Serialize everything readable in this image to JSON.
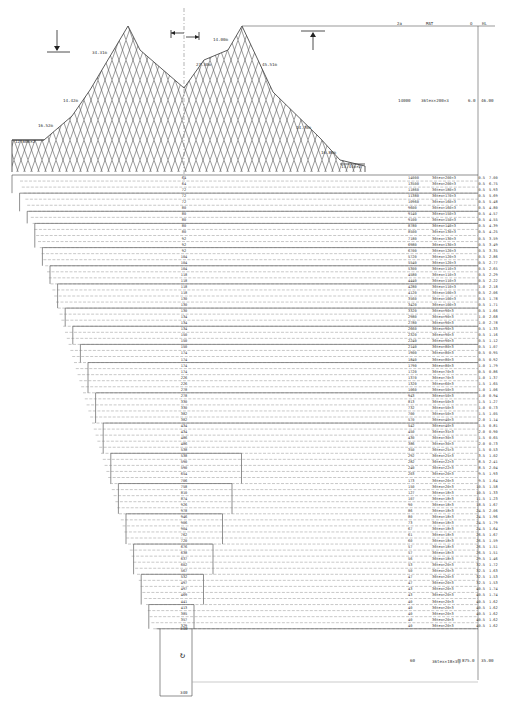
{
  "table": {
    "headers": {
      "n": "2a",
      "mat": "MAT",
      "o": "O",
      "hl": "HL"
    },
    "wing_row": {
      "n": "14000",
      "mat": "36tex×200×3",
      "o": "6.0",
      "hl": "46.00"
    },
    "codend_row": {
      "n": "60",
      "mat": "36tex×18×3单",
      "o": "875.0",
      "hl": "35.00"
    },
    "rows": [
      {
        "mesh": "64",
        "n": "14000",
        "mat": "36tex×200×3",
        "o": "0.5",
        "hl": "7.00"
      },
      {
        "mesh": "64",
        "n": "13500",
        "mat": "36tex×200×3",
        "o": "0.5",
        "hl": "6.75"
      },
      {
        "mesh": "72",
        "n": "11860",
        "mat": "36tex×180×3",
        "o": "0.5",
        "hl": "5.93"
      },
      {
        "mesh": "72",
        "n": "11380",
        "mat": "36tex×170×3",
        "o": "0.5",
        "hl": "5.69"
      },
      {
        "mesh": "72",
        "n": "10960",
        "mat": "36tex×160×3",
        "o": "0.5",
        "hl": "5.48"
      },
      {
        "mesh": "80",
        "n": "9600",
        "mat": "36tex×160×3",
        "o": "0.5",
        "hl": "4.80"
      },
      {
        "mesh": "80",
        "n": "9140",
        "mat": "36tex×150×3",
        "o": "0.5",
        "hl": "4.57"
      },
      {
        "mesh": "80",
        "n": "9100",
        "mat": "36tex×150×3",
        "o": "0.5",
        "hl": "4.55"
      },
      {
        "mesh": "80",
        "n": "8780",
        "mat": "36tex×140×3",
        "o": "0.5",
        "hl": "4.39"
      },
      {
        "mesh": "80",
        "n": "8500",
        "mat": "36tex×130×3",
        "o": "0.5",
        "hl": "4.25"
      },
      {
        "mesh": "92",
        "n": "7180",
        "mat": "36tex×130×3",
        "o": "0.5",
        "hl": "3.59"
      },
      {
        "mesh": "92",
        "n": "6980",
        "mat": "36tex×130×3",
        "o": "0.5",
        "hl": "3.49"
      },
      {
        "mesh": "92",
        "n": "6700",
        "mat": "36tex×120×3",
        "o": "0.5",
        "hl": "3.35"
      },
      {
        "mesh": "104",
        "n": "5720",
        "mat": "36tex×120×3",
        "o": "0.5",
        "hl": "2.86"
      },
      {
        "mesh": "104",
        "n": "5540",
        "mat": "36tex×120×3",
        "o": "0.5",
        "hl": "2.77"
      },
      {
        "mesh": "104",
        "n": "5300",
        "mat": "36tex×110×3",
        "o": "0.5",
        "hl": "2.65"
      },
      {
        "mesh": "118",
        "n": "4580",
        "mat": "36tex×110×3",
        "o": "0.5",
        "hl": "2.29"
      },
      {
        "mesh": "118",
        "n": "4440",
        "mat": "36tex×110×3",
        "o": "0.5",
        "hl": "2.22"
      },
      {
        "mesh": "118",
        "n": "4280",
        "mat": "36tex×110×3",
        "o": "1.0",
        "hl": "2.18"
      },
      {
        "mesh": "118",
        "n": "4120",
        "mat": "36tex×100×3",
        "o": "0.5",
        "hl": "2.06"
      },
      {
        "mesh": "130",
        "n": "3560",
        "mat": "36tex×100×3",
        "o": "0.5",
        "hl": "1.78"
      },
      {
        "mesh": "130",
        "n": "3420",
        "mat": "36tex×100×3",
        "o": "0.5",
        "hl": "1.71"
      },
      {
        "mesh": "130",
        "n": "3320",
        "mat": "36tex×90×3",
        "o": "0.5",
        "hl": "1.66"
      },
      {
        "mesh": "134",
        "n": "2980",
        "mat": "36tex×90×3",
        "o": "1.0",
        "hl": "2.68"
      },
      {
        "mesh": "134",
        "n": "2780",
        "mat": "36tex×90×3",
        "o": "1.0",
        "hl": "2.78"
      },
      {
        "mesh": "134",
        "n": "2660",
        "mat": "36tex×90×3",
        "o": "0.5",
        "hl": "1.33"
      },
      {
        "mesh": "150",
        "n": "2320",
        "mat": "36tex×90×3",
        "o": "0.5",
        "hl": "1.16"
      },
      {
        "mesh": "150",
        "n": "2240",
        "mat": "36tex×90×3",
        "o": "0.5",
        "hl": "1.12"
      },
      {
        "mesh": "150",
        "n": "2140",
        "mat": "36tex×80×3",
        "o": "0.5",
        "hl": "1.07"
      },
      {
        "mesh": "174",
        "n": "1900",
        "mat": "36tex×80×3",
        "o": "0.5",
        "hl": "0.95"
      },
      {
        "mesh": "174",
        "n": "1840",
        "mat": "36tex×80×3",
        "o": "0.5",
        "hl": "0.92"
      },
      {
        "mesh": "174",
        "n": "1790",
        "mat": "36tex×80×3",
        "o": "1.0",
        "hl": "1.79"
      },
      {
        "mesh": "174",
        "n": "1720",
        "mat": "36tex×70×3",
        "o": "0.5",
        "hl": "0.86"
      },
      {
        "mesh": "226",
        "n": "1370",
        "mat": "36tex×70×3",
        "o": "1.0",
        "hl": "1.37"
      },
      {
        "mesh": "226",
        "n": "1320",
        "mat": "36tex×60×3",
        "o": "1.5",
        "hl": "1.65"
      },
      {
        "mesh": "278",
        "n": "1060",
        "mat": "36tex×50×3",
        "o": "1.0",
        "hl": "1.06"
      },
      {
        "mesh": "278",
        "n": "943",
        "mat": "36tex×50×3",
        "o": "1.0",
        "hl": "0.94"
      },
      {
        "mesh": "330",
        "n": "813",
        "mat": "36tex×50×3",
        "o": "1.5",
        "hl": "1.27"
      },
      {
        "mesh": "330",
        "n": "732",
        "mat": "36tex×50×3",
        "o": "1.0",
        "hl": "0.73"
      },
      {
        "mesh": "382",
        "n": "700",
        "mat": "36tex×50×3",
        "o": "1.5",
        "hl": "1.05"
      },
      {
        "mesh": "382",
        "n": "570",
        "mat": "36tex×40×3",
        "o": "2.0",
        "hl": "1.14"
      },
      {
        "mesh": "434",
        "n": "542",
        "mat": "36tex×40×3",
        "o": "1.5",
        "hl": "0.81"
      },
      {
        "mesh": "434",
        "n": "450",
        "mat": "36tex×35×3",
        "o": "2.0",
        "hl": "0.90"
      },
      {
        "mesh": "486",
        "n": "430",
        "mat": "36tex×30×3",
        "o": "1.5",
        "hl": "0.65"
      },
      {
        "mesh": "486",
        "n": "386",
        "mat": "36tex×30×3",
        "o": "2.0",
        "hl": "0.73"
      },
      {
        "mesh": "538",
        "n": "350",
        "mat": "36tex×25×3",
        "o": "1.5",
        "hl": "0.53"
      },
      {
        "mesh": "538",
        "n": "292",
        "mat": "36tex×25×3",
        "o": "3.5",
        "hl": "1.02"
      },
      {
        "mesh": "590",
        "n": "282",
        "mat": "36tex×22×3",
        "o": "8.5",
        "hl": "2.41"
      },
      {
        "mesh": "590",
        "n": "240",
        "mat": "36tex×22×3",
        "o": "8.5",
        "hl": "2.04"
      },
      {
        "mesh": "654",
        "n": "203",
        "mat": "36tex×20×3",
        "o": "9.5",
        "hl": "1.93"
      },
      {
        "mesh": "706",
        "n": "173",
        "mat": "36tex×20×3",
        "o": "9.5",
        "hl": "1.64"
      },
      {
        "mesh": "758",
        "n": "150",
        "mat": "36tex×20×3",
        "o": "10.5",
        "hl": "1.58"
      },
      {
        "mesh": "810",
        "n": "127",
        "mat": "36tex×18×3",
        "o": "10.5",
        "hl": "1.33"
      },
      {
        "mesh": "874",
        "n": "107",
        "mat": "36tex×18×3",
        "o": "11.5",
        "hl": "1.23"
      },
      {
        "mesh": "926",
        "n": "90",
        "mat": "36tex×18×3",
        "o": "18.5",
        "hl": "1.67"
      },
      {
        "mesh": "978",
        "n": "86",
        "mat": "36tex×18×3",
        "o": "24.5",
        "hl": "2.06"
      },
      {
        "mesh": "946",
        "n": "80",
        "mat": "36tex×18×3",
        "o": "24.5",
        "hl": "1.96"
      },
      {
        "mesh": "906",
        "n": "73",
        "mat": "36tex×18×3",
        "o": "24.5",
        "hl": "1.79"
      },
      {
        "mesh": "904",
        "n": "67",
        "mat": "36tex×18×3",
        "o": "24.5",
        "hl": "1.64"
      },
      {
        "mesh": "762",
        "n": "61",
        "mat": "36tex×18×3",
        "o": "26.5",
        "hl": "1.67"
      },
      {
        "mesh": "720",
        "n": "60",
        "mat": "36tex×18×3",
        "o": "26.5",
        "hl": "1.59"
      },
      {
        "mesh": "676",
        "n": "57",
        "mat": "36tex×18×3",
        "o": "26.5",
        "hl": "1.51"
      },
      {
        "mesh": "638",
        "n": "57",
        "mat": "36tex×18×3",
        "o": "26.5",
        "hl": "1.51"
      },
      {
        "mesh": "637",
        "n": "56",
        "mat": "36tex×18×3",
        "o": "29.5",
        "hl": "1.46"
      },
      {
        "mesh": "602",
        "n": "53",
        "mat": "36tex×20×3",
        "o": "32.5",
        "hl": "1.72"
      },
      {
        "mesh": "567",
        "n": "50",
        "mat": "36tex×20×3",
        "o": "32.5",
        "hl": "1.63"
      },
      {
        "mesh": "532",
        "n": "47",
        "mat": "36tex×20×3",
        "o": "32.5",
        "hl": "1.53"
      },
      {
        "mesh": "497",
        "n": "47",
        "mat": "36tex×20×3",
        "o": "32.5",
        "hl": "1.53"
      },
      {
        "mesh": "497",
        "n": "43",
        "mat": "36tex×20×3",
        "o": "40.5",
        "hl": "1.74"
      },
      {
        "mesh": "469",
        "n": "43",
        "mat": "36tex×20×3",
        "o": "40.5",
        "hl": "1.74"
      },
      {
        "mesh": "441",
        "n": "40",
        "mat": "36tex×20×3",
        "o": "40.5",
        "hl": "1.62"
      },
      {
        "mesh": "413",
        "n": "40",
        "mat": "36tex×20×3",
        "o": "40.5",
        "hl": "1.62"
      },
      {
        "mesh": "385",
        "n": "40",
        "mat": "36tex×20×3",
        "o": "40.5",
        "hl": "1.62"
      },
      {
        "mesh": "357",
        "n": "40",
        "mat": "36tex×20×3",
        "o": "40.5",
        "hl": "1.62"
      },
      {
        "mesh": "329",
        "n": "40",
        "mat": "36tex×20×3",
        "o": "40.5",
        "hl": "1.62"
      }
    ],
    "codend_mesh_top": "340",
    "codend_mesh_bottom": "340"
  },
  "wing_labels": [
    {
      "text": "34.31m",
      "x": 92,
      "y": 50
    },
    {
      "text": "14.00m",
      "x": 213,
      "y": 37
    },
    {
      "text": "27.30m",
      "x": 196,
      "y": 62
    },
    {
      "text": "45.51m",
      "x": 262,
      "y": 62
    },
    {
      "text": "14.42m",
      "x": 63,
      "y": 98
    },
    {
      "text": "16.52m",
      "x": 38,
      "y": 123
    },
    {
      "text": "12.60m×2",
      "x": 15,
      "y": 139
    },
    {
      "text": "14.70m",
      "x": 296,
      "y": 125
    },
    {
      "text": "16.80m",
      "x": 321,
      "y": 150
    },
    {
      "text": "13.44m×2",
      "x": 341,
      "y": 164
    }
  ],
  "colors": {
    "line": "#444444",
    "dash": "#777777",
    "text": "#333333"
  }
}
